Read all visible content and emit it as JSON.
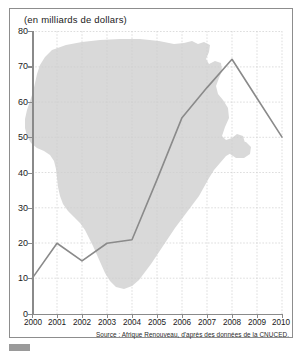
{
  "chart_data": {
    "type": "line",
    "title": "(en milliards de dollars)",
    "xlabel": "",
    "ylabel": "",
    "categories": [
      "2000",
      "2001",
      "2002",
      "2003",
      "2004",
      "2005",
      "2006",
      "2007",
      "2008",
      "2009",
      "2010"
    ],
    "x": [
      2000,
      2001,
      2002,
      2003,
      2004,
      2005,
      2006,
      2007,
      2008,
      2009,
      2010
    ],
    "values": [
      10,
      20,
      15,
      20,
      21,
      38,
      55.5,
      64,
      72,
      61,
      50
    ],
    "series": [
      {
        "name": "Investissements directs etrangers en Afrique",
        "values": [
          10,
          20,
          15,
          20,
          21,
          38,
          55.5,
          64,
          72,
          61,
          50
        ]
      }
    ],
    "xlim": [
      2000,
      2010
    ],
    "ylim": [
      0,
      80
    ],
    "yticks": [
      0,
      10,
      20,
      30,
      40,
      50,
      60,
      70,
      80
    ],
    "xticks": [
      2000,
      2001,
      2002,
      2003,
      2004,
      2005,
      2006,
      2007,
      2008,
      2009,
      2010
    ],
    "grid": true,
    "legend": false,
    "line_color": "#8a8a8a",
    "background_silhouette": "africa-map",
    "silhouette_color": "#d9d9d9",
    "source": "Source : Afrique Renouveau, d'après des données de la CNUCED."
  },
  "figure": {
    "title": "(en milliards de dollars)",
    "source": "Source : Afrique Renouveau, d'après des données de la CNUCED."
  },
  "axes": {
    "y_labels": [
      "80",
      "70",
      "60",
      "50",
      "40",
      "30",
      "20",
      "10",
      "0"
    ],
    "x_labels": [
      "2000",
      "2001",
      "2002",
      "2003",
      "2004",
      "2005",
      "2006",
      "2007",
      "2008",
      "2009",
      "2010"
    ]
  },
  "colors": {
    "line": "#8a8a8a",
    "grid": "#cfcfcf",
    "silhouette": "#d9d9d9",
    "frame": "#8d8d8d",
    "text": "#1a1a1a"
  }
}
